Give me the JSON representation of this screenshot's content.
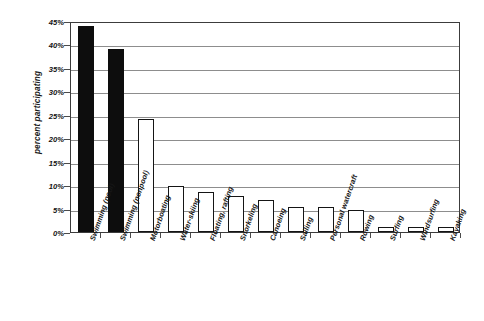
{
  "chart_data": {
    "type": "bar",
    "title": "",
    "xlabel": "",
    "ylabel": "percent participating",
    "ylim": [
      0,
      45
    ],
    "ytick_labels": [
      "0%",
      "5%",
      "10%",
      "15%",
      "20%",
      "25%",
      "30%",
      "35%",
      "40%",
      "45%"
    ],
    "ytick_values": [
      0,
      5,
      10,
      15,
      20,
      25,
      30,
      35,
      40,
      45
    ],
    "grid": true,
    "legend": "none",
    "categories": [
      "Swimming (pool)",
      "Swimming (nonpool)",
      "Motorboating",
      "Water-skiing",
      "Floating, rafting",
      "Snorkeling",
      "Canoeing",
      "Sailing",
      "Personal watercraft",
      "Rowing",
      "Surfing",
      "Windsurfing",
      "Kayaking"
    ],
    "values": [
      44,
      39,
      24,
      9.8,
      8.5,
      7.7,
      6.9,
      5.4,
      5.4,
      4.6,
      1.1,
      1.1,
      1.1
    ],
    "bar_fill": [
      "filled",
      "filled",
      "hollow",
      "hollow",
      "hollow",
      "hollow",
      "hollow",
      "hollow",
      "hollow",
      "hollow",
      "hollow",
      "hollow",
      "hollow"
    ],
    "colors": {
      "filled_bar": "#0d0d0d",
      "hollow_bar_fill": "#ffffff",
      "bar_outline": "#151515",
      "gridline": "#8d8d8d",
      "axis": "#3c3c3c",
      "text": "#171717",
      "background": "#ffffff"
    }
  }
}
